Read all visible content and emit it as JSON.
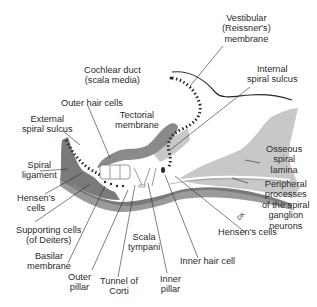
{
  "diagram": {
    "colors": {
      "dark_tissue": "#7a7a7a",
      "light_tissue": "#c8c8c8",
      "mid_tissue": "#9a9a9a",
      "line": "#2a2a2a",
      "background": "#ffffff"
    },
    "labels": {
      "vestibular": [
        "Vestibular",
        "(Reissner's)",
        "membrane"
      ],
      "cochlear_duct": [
        "Cochlear duct",
        "(scala media)"
      ],
      "internal_sulcus": [
        "Internal",
        "spiral sulcus"
      ],
      "outer_hair": "Outer hair cells",
      "tectorial": [
        "Tectorial",
        "membrane"
      ],
      "external_sulcus": [
        "External",
        "spiral sulcus"
      ],
      "osseous": [
        "Osseous",
        "spiral",
        "lamina"
      ],
      "spiral_ligament": [
        "Spiral",
        "ligament"
      ],
      "peripheral": [
        "Peripheral",
        "processes",
        "of the spiral",
        "ganglion",
        "neurons"
      ],
      "hensens_left": [
        "Hensen's",
        "cells"
      ],
      "hensens_right": "Hensen's cells",
      "supporting": [
        "Supporting cells",
        "(of Deiters)"
      ],
      "scala_tympani": [
        "Scala",
        "tympani"
      ],
      "inner_hair": "Inner hair cell",
      "basilar": [
        "Basilar",
        "membrane"
      ],
      "outer_pillar": [
        "Outer",
        "pillar"
      ],
      "tunnel": [
        "Tunnel of",
        "Corti"
      ],
      "inner_pillar": [
        "Inner",
        "pillar"
      ],
      "signature": "DK"
    }
  }
}
